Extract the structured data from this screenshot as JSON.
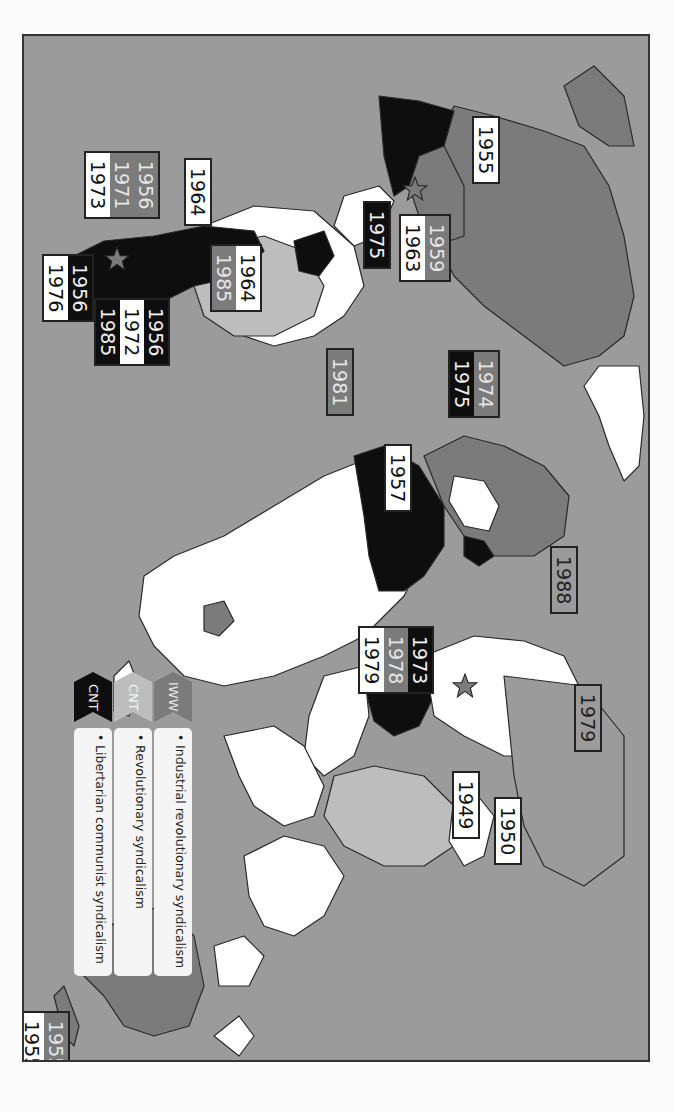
{
  "map": {
    "title": "Syndicalist and revolutionary union foundings by country (rotated view)",
    "orientation": "rotated 90 degrees clockwise",
    "colors": {
      "ocean": "#9b9b9b",
      "unaffiliated_land": "#ffffff",
      "iww": "#7b7b7b",
      "cnt_revolutionary": "#bdbdbd",
      "cnt_libertarian": "#0e0e0e",
      "frame_border": "#333333"
    },
    "legend": [
      {
        "tag": "IWW",
        "description": "Industrial revolutionary syndicalism",
        "style": "iww"
      },
      {
        "tag": "CNT",
        "description": "Revolutionary syndicalism",
        "style": "light"
      },
      {
        "tag": "CNT",
        "description": "Libertarian communist syndicalism",
        "style": "black"
      }
    ],
    "labels": [
      {
        "id": "north-america-1955",
        "region": "Canada/USA",
        "years": [
          {
            "y": "1955",
            "style": "white"
          }
        ]
      },
      {
        "id": "mexico",
        "region": "Mexico",
        "years": [
          {
            "y": "1959",
            "style": "iww"
          },
          {
            "y": "1963",
            "style": "white"
          }
        ]
      },
      {
        "id": "central-america-1975",
        "region": "Central America",
        "years": [
          {
            "y": "1975",
            "style": "black"
          }
        ]
      },
      {
        "id": "andes-1964",
        "region": "Andes",
        "years": [
          {
            "y": "1964",
            "style": "white"
          }
        ]
      },
      {
        "id": "brazil",
        "region": "Brazil",
        "years": [
          {
            "y": "1964",
            "style": "white"
          },
          {
            "y": "1985",
            "style": "iww"
          }
        ]
      },
      {
        "id": "chile",
        "region": "Chile",
        "years": [
          {
            "y": "1956",
            "style": "iww"
          },
          {
            "y": "1971",
            "style": "iww"
          },
          {
            "y": "1973",
            "style": "white"
          }
        ]
      },
      {
        "id": "argentina",
        "region": "Argentina",
        "years": [
          {
            "y": "1956",
            "style": "black"
          },
          {
            "y": "1976",
            "style": "white"
          }
        ]
      },
      {
        "id": "uruguay",
        "region": "Uruguay/Paraguay",
        "years": [
          {
            "y": "1956",
            "style": "black"
          },
          {
            "y": "1972",
            "style": "white"
          },
          {
            "y": "1985",
            "style": "black"
          }
        ]
      },
      {
        "id": "west-africa-1981",
        "region": "West Africa",
        "years": [
          {
            "y": "1981",
            "style": "iww"
          }
        ]
      },
      {
        "id": "iberia",
        "region": "Iberia",
        "years": [
          {
            "y": "1974",
            "style": "iww"
          },
          {
            "y": "1975",
            "style": "black"
          }
        ]
      },
      {
        "id": "north-africa-1957",
        "region": "North Africa",
        "years": [
          {
            "y": "1957",
            "style": "white"
          }
        ]
      },
      {
        "id": "eastern-europe-1988",
        "region": "Eastern Europe",
        "years": [
          {
            "y": "1988",
            "style": "gray"
          }
        ]
      },
      {
        "id": "middle-east",
        "region": "Middle East",
        "years": [
          {
            "y": "1973",
            "style": "black"
          },
          {
            "y": "1978",
            "style": "iww"
          },
          {
            "y": "1979",
            "style": "white"
          }
        ]
      },
      {
        "id": "russia-1979",
        "region": "Russia",
        "years": [
          {
            "y": "1979",
            "style": "gray"
          }
        ]
      },
      {
        "id": "china-1949",
        "region": "China",
        "years": [
          {
            "y": "1949",
            "style": "white"
          }
        ]
      },
      {
        "id": "mongolia-1950",
        "region": "Mongolia",
        "years": [
          {
            "y": "1950",
            "style": "white"
          }
        ]
      },
      {
        "id": "new-zealand",
        "region": "New Zealand",
        "years": [
          {
            "y": "1955",
            "style": "iww"
          },
          {
            "y": "1955",
            "style": "white"
          }
        ]
      }
    ]
  }
}
